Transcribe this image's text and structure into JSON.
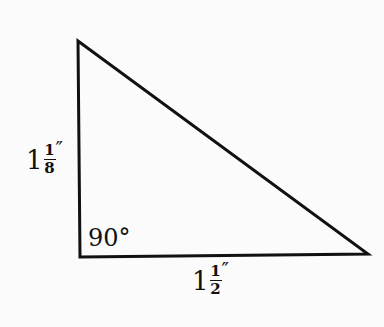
{
  "diagram": {
    "type": "right-triangle",
    "vertices": [
      {
        "name": "top",
        "x": 78,
        "y": 41
      },
      {
        "name": "right-angle",
        "x": 80,
        "y": 257
      },
      {
        "name": "bottom-right",
        "x": 368,
        "y": 254
      }
    ],
    "stroke_color": "#111111",
    "angle_label": "90°",
    "vertical_side": {
      "whole": "1",
      "numerator": "1",
      "denominator": "8",
      "unit": "″"
    },
    "horizontal_side": {
      "whole": "1",
      "numerator": "1",
      "denominator": "2",
      "unit": "″"
    }
  }
}
